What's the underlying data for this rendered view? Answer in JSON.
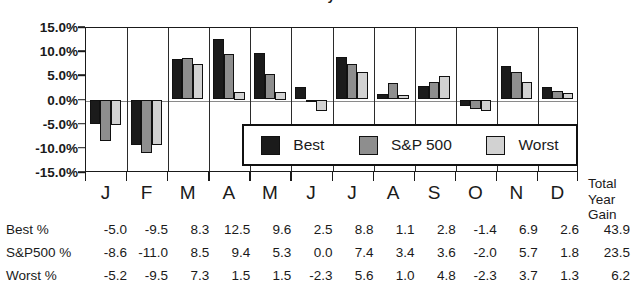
{
  "chart_data": {
    "type": "bar",
    "title": "Four-Year Presidential Election Cycle Best/Worst Months Chart",
    "xlabel": "",
    "ylabel": "",
    "ylim": [
      -15.0,
      15.0
    ],
    "ytick_labels": [
      "15.0%",
      "10.0%",
      "5.0%",
      "0.0%",
      "-5.0%",
      "-10.0%",
      "-15.0%"
    ],
    "ytick_values": [
      15.0,
      10.0,
      5.0,
      0.0,
      -5.0,
      -10.0,
      -15.0
    ],
    "grid": true,
    "legend_position": "inside-lower-right",
    "categories": [
      "J",
      "F",
      "M",
      "A",
      "M",
      "J",
      "J",
      "A",
      "S",
      "O",
      "N",
      "D"
    ],
    "series": [
      {
        "name": "Best",
        "color": "#1b1b1b",
        "values": [
          -5.0,
          -9.5,
          8.3,
          12.5,
          9.6,
          2.5,
          8.8,
          1.1,
          2.8,
          -1.4,
          6.9,
          2.6
        ],
        "total_year_gain": 43.9
      },
      {
        "name": "S&P 500",
        "color": "#8e8e8e",
        "values": [
          -8.6,
          -11.0,
          8.5,
          9.4,
          5.3,
          0.0,
          7.4,
          3.4,
          3.6,
          -2.0,
          5.7,
          1.8
        ],
        "total_year_gain": 23.5
      },
      {
        "name": "Worst",
        "color": "#d2d2d2",
        "values": [
          -5.2,
          -9.5,
          7.3,
          1.5,
          1.5,
          -2.3,
          5.6,
          1.0,
          4.8,
          -2.3,
          3.7,
          1.3
        ],
        "total_year_gain": 6.2
      }
    ]
  },
  "legend": {
    "items": [
      {
        "label": "Best"
      },
      {
        "label": "S&P 500"
      },
      {
        "label": "Worst"
      }
    ]
  },
  "table": {
    "total_header_lines": [
      "Total",
      "Year",
      "Gain"
    ],
    "rows": [
      {
        "label": "Best %",
        "values": [
          "-5.0",
          "-9.5",
          "8.3",
          "12.5",
          "9.6",
          "2.5",
          "8.8",
          "1.1",
          "2.8",
          "-1.4",
          "6.9",
          "2.6"
        ],
        "total": "43.9"
      },
      {
        "label": "S&P500 %",
        "values": [
          "-8.6",
          "-11.0",
          "8.5",
          "9.4",
          "5.3",
          "0.0",
          "7.4",
          "3.4",
          "3.6",
          "-2.0",
          "5.7",
          "1.8"
        ],
        "total": "23.5"
      },
      {
        "label": "Worst %",
        "values": [
          "-5.2",
          "-9.5",
          "7.3",
          "1.5",
          "1.5",
          "-2.3",
          "5.6",
          "1.0",
          "4.8",
          "-2.3",
          "3.7",
          "1.3"
        ],
        "total": "6.2"
      }
    ]
  }
}
